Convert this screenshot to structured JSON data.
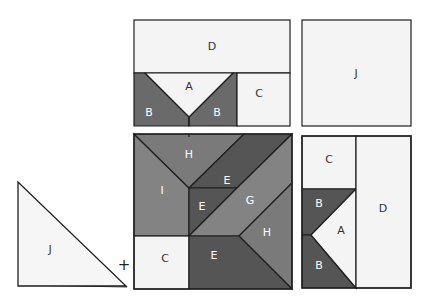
{
  "figure": {
    "colors": {
      "white_piece": "#f4f4f4",
      "light_gray": "#838383",
      "mid_gray": "#6a6a6a",
      "dark_gray": "#555555",
      "outline": "#1e1e1e"
    },
    "top_left_panel": {
      "pieces": [
        {
          "id": "D",
          "label": "D"
        },
        {
          "id": "A",
          "label": "A"
        },
        {
          "id": "B1",
          "label": "B"
        },
        {
          "id": "B2",
          "label": "B"
        },
        {
          "id": "C",
          "label": "C"
        }
      ]
    },
    "top_right_panel": {
      "pieces": [
        {
          "id": "J",
          "label": "J"
        }
      ]
    },
    "triangle_piece": {
      "label": "J"
    },
    "operator": "+",
    "main_square": {
      "pieces": [
        {
          "id": "H1",
          "label": "H"
        },
        {
          "id": "I",
          "label": "I"
        },
        {
          "id": "E1",
          "label": "E"
        },
        {
          "id": "E2",
          "label": "E"
        },
        {
          "id": "G",
          "label": "G"
        },
        {
          "id": "H2",
          "label": "H"
        },
        {
          "id": "C",
          "label": "C"
        },
        {
          "id": "E3",
          "label": "E"
        }
      ]
    },
    "bottom_right_panel": {
      "pieces": [
        {
          "id": "C",
          "label": "C"
        },
        {
          "id": "B1",
          "label": "B"
        },
        {
          "id": "A",
          "label": "A"
        },
        {
          "id": "B2",
          "label": "B"
        },
        {
          "id": "D",
          "label": "D"
        }
      ]
    }
  }
}
